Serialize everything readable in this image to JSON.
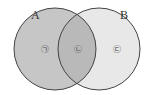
{
  "diagram": {
    "type": "venn",
    "sets": [
      {
        "label": "A",
        "fill": "#c6c6c6"
      },
      {
        "label": "B",
        "fill": "#e8e8e8"
      }
    ],
    "intersection_fill": "#b9b9b9",
    "stroke": "#444444",
    "regions": [
      {
        "label": "㉠",
        "position": "A only"
      },
      {
        "label": "㉡",
        "position": "A and B"
      },
      {
        "label": "㉢",
        "position": "B only"
      }
    ]
  }
}
